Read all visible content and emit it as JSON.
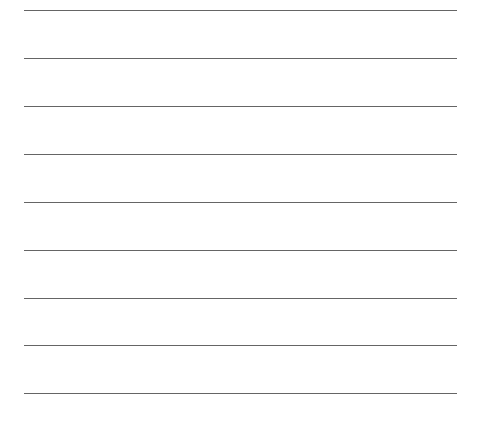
{
  "page": {
    "type": "lined-paper",
    "line_color": "#4a4a4a",
    "background": "#ffffff",
    "lines": [
      {
        "y": 10
      },
      {
        "y": 58
      },
      {
        "y": 106
      },
      {
        "y": 154
      },
      {
        "y": 202
      },
      {
        "y": 250
      },
      {
        "y": 298
      },
      {
        "y": 345
      },
      {
        "y": 393
      }
    ]
  }
}
